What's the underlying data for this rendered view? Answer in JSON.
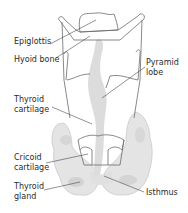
{
  "diagram": {
    "colors": {
      "outline": "#6b6b6b",
      "gland_fill": "#e4e4e4",
      "gland_shade": "#d2d2d2",
      "leader_line": "#4a4a4a",
      "text": "#2b2b2b",
      "background": "#ffffff"
    },
    "labels": {
      "epiglottis": "Epiglottis",
      "hyoid_bone": "Hyoid bone",
      "pyramid_lobe_line1": "Pyramid",
      "pyramid_lobe_line2": "lobe",
      "thyroid_cartilage_line1": "Thyroid",
      "thyroid_cartilage_line2": "cartilage",
      "cricoid_cartilage_line1": "Cricoid",
      "cricoid_cartilage_line2": "cartilage",
      "thyroid_gland_line1": "Thyroid",
      "thyroid_gland_line2": "gland",
      "isthmus": "Isthmus"
    }
  }
}
